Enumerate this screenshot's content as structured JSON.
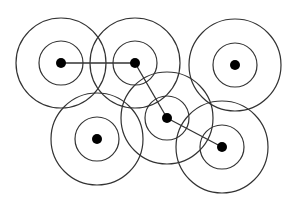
{
  "diagram": {
    "type": "node-range-network",
    "stroke_color": "#333333",
    "node_color": "#000000",
    "background": "#ffffff",
    "nodes": [
      {
        "id": "A",
        "cx": 61,
        "cy": 63,
        "inner_r": 22,
        "outer_r": 45,
        "dot_r": 5
      },
      {
        "id": "B",
        "cx": 135,
        "cy": 63,
        "inner_r": 22,
        "outer_r": 45,
        "dot_r": 5
      },
      {
        "id": "C",
        "cx": 235,
        "cy": 65,
        "inner_r": 22,
        "outer_r": 46,
        "dot_r": 5
      },
      {
        "id": "D",
        "cx": 97,
        "cy": 139,
        "inner_r": 22,
        "outer_r": 46,
        "dot_r": 5
      },
      {
        "id": "E",
        "cx": 167,
        "cy": 118,
        "inner_r": 22,
        "outer_r": 46,
        "dot_r": 5
      },
      {
        "id": "F",
        "cx": 222,
        "cy": 147,
        "inner_r": 22,
        "outer_r": 46,
        "dot_r": 5
      }
    ],
    "edges": [
      {
        "from": "A",
        "to": "B"
      },
      {
        "from": "B",
        "to": "E"
      },
      {
        "from": "E",
        "to": "F"
      }
    ]
  }
}
